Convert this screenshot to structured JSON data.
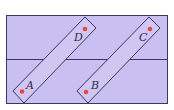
{
  "diagram": {
    "title": "",
    "colors": {
      "background": "#ffffff",
      "field_fill": "#c9bff0",
      "strip_fill": "#cfc6f2",
      "stroke": "#3d3660",
      "dot": "#e8483f"
    },
    "points": [
      {
        "label": "A",
        "x": 22,
        "y": 91
      },
      {
        "label": "B",
        "x": 86,
        "y": 92
      },
      {
        "label": "C",
        "x": 150,
        "y": 29
      },
      {
        "label": "D",
        "x": 85,
        "y": 29
      }
    ],
    "labels": {
      "A": "A",
      "B": "B",
      "C": "C",
      "D": "D"
    }
  }
}
